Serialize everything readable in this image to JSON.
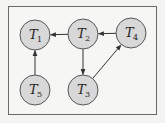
{
  "diagram": {
    "type": "directed-graph",
    "colors": {
      "background": "#f4f4f2",
      "frame": "#6a6a6a",
      "node_fill": "#d8d8d8",
      "node_stroke": "#555555",
      "edge": "#333333"
    },
    "nodes": [
      {
        "id": "T1",
        "letter": "T",
        "sub": "1",
        "cx": 35,
        "cy": 35
      },
      {
        "id": "T2",
        "letter": "T",
        "sub": "2",
        "cx": 83,
        "cy": 34
      },
      {
        "id": "T4",
        "letter": "T",
        "sub": "4",
        "cx": 131,
        "cy": 33
      },
      {
        "id": "T5",
        "letter": "T",
        "sub": "5",
        "cx": 35,
        "cy": 90
      },
      {
        "id": "T3",
        "letter": "T",
        "sub": "3",
        "cx": 83,
        "cy": 90
      }
    ],
    "edges": [
      {
        "from": "T2",
        "to": "T1"
      },
      {
        "from": "T4",
        "to": "T2"
      },
      {
        "from": "T2",
        "to": "T3"
      },
      {
        "from": "T3",
        "to": "T4"
      },
      {
        "from": "T5",
        "to": "T1"
      }
    ]
  }
}
